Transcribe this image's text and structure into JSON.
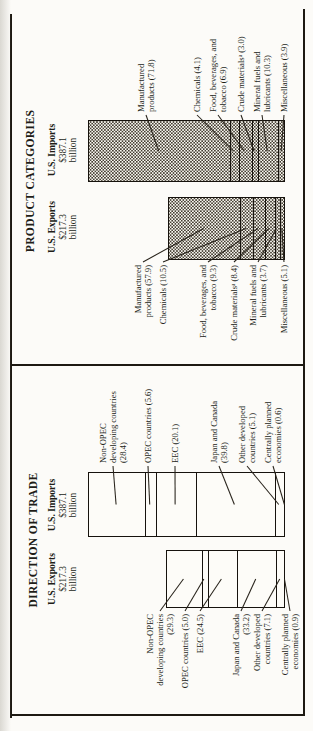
{
  "colors": {
    "ink": "#211d17",
    "paper": "#fcfbf8",
    "rule": "#1d1912"
  },
  "chart_data": [
    {
      "type": "bar",
      "stacked": true,
      "orientation": "vertical",
      "title": "DIRECTION OF TRADE",
      "values_are": "percent of total",
      "legend_position": "none",
      "grid": false,
      "bars": [
        {
          "label": "U.S. Exports",
          "total_label": "$217.3",
          "total_unit": "billion",
          "total_billions": 217.3,
          "label_side": "left",
          "segments": [
            {
              "name": "Non-OPEC developing countries",
              "value": 29.3,
              "label_lines": [
                "Non-OPEC",
                "developing countries",
                "(29.3)"
              ]
            },
            {
              "name": "OPEC countries",
              "value": 5.0,
              "label_lines": [
                "OPEC countries (5.0)"
              ]
            },
            {
              "name": "EEC",
              "value": 24.5,
              "label_lines": [
                "EEC (24.5)"
              ]
            },
            {
              "name": "Japan and Canada",
              "value": 33.2,
              "label_lines": [
                "Japan and Canada",
                "(33.2)"
              ]
            },
            {
              "name": "Other developed countries",
              "value": 7.1,
              "label_lines": [
                "Other developed",
                "countries (7.1)"
              ]
            },
            {
              "name": "Centrally planned economies",
              "value": 0.9,
              "label_lines": [
                "Centrally planned",
                "economies (0.9)"
              ]
            }
          ]
        },
        {
          "label": "U.S. Imports",
          "total_label": "$387.1",
          "total_unit": "billion",
          "total_billions": 387.1,
          "label_side": "right",
          "segments": [
            {
              "name": "Non-OPEC developing countries",
              "value": 28.4,
              "label_lines": [
                "Non-OPEC",
                "developing countries",
                "(28.4)"
              ]
            },
            {
              "name": "OPEC countries",
              "value": 5.6,
              "label_lines": [
                "OPEC countries (5.6)"
              ]
            },
            {
              "name": "EEC",
              "value": 20.1,
              "label_lines": [
                "EEC (20.1)"
              ]
            },
            {
              "name": "Japan and Canada",
              "value": 39.8,
              "label_lines": [
                "Japan and Canada",
                "(39.8)"
              ]
            },
            {
              "name": "Other developed countries",
              "value": 5.1,
              "label_lines": [
                "Other developed",
                "countries (5.1)"
              ]
            },
            {
              "name": "Centrally planned economies",
              "value": 0.6,
              "label_lines": [
                "Centrally planned",
                "economies (0.6)"
              ]
            }
          ]
        }
      ]
    },
    {
      "type": "bar",
      "stacked": true,
      "orientation": "vertical",
      "title": "PRODUCT CATEGORIES",
      "values_are": "percent of total",
      "fill_pattern": "stipple-dots",
      "legend_position": "none",
      "grid": false,
      "bars": [
        {
          "label": "U.S. Exports",
          "total_label": "$217.3",
          "total_unit": "billion",
          "total_billions": 217.3,
          "label_side": "left",
          "segments": [
            {
              "name": "Manufactured products",
              "value": 57.9,
              "label_lines": [
                "Manufactured",
                "products (57.9)"
              ]
            },
            {
              "name": "Chemicals",
              "value": 10.5,
              "label_lines": [
                "Chemicals (10.5)"
              ]
            },
            {
              "name": "Food, beverages, and tobacco",
              "value": 9.3,
              "label_lines": [
                "Food, beverages, and",
                "tobacco (9.3)"
              ]
            },
            {
              "name": "Crude materials",
              "value": 8.4,
              "label_lines": [
                "Crude materialsᵃ (8.4)"
              ]
            },
            {
              "name": "Mineral fuels and lubricants",
              "value": 3.7,
              "label_lines": [
                "Mineral fuels and",
                "lubricants (3.7)"
              ]
            },
            {
              "name": "Miscellaneous",
              "value": 5.1,
              "label_lines": [
                "Miscellaneous (5.1)"
              ]
            }
          ]
        },
        {
          "label": "U.S. Imports",
          "total_label": "$387.1",
          "total_unit": "billion",
          "total_billions": 387.1,
          "label_side": "right",
          "segments": [
            {
              "name": "Manufactured products",
              "value": 71.8,
              "label_lines": [
                "Manufactured",
                "products (71.8)"
              ]
            },
            {
              "name": "Chemicals",
              "value": 4.1,
              "label_lines": [
                "Chemicals (4.1)"
              ]
            },
            {
              "name": "Food, beverages, and tobacco",
              "value": 6.9,
              "label_lines": [
                "Food, beverages, and",
                "tobacco (6.9)"
              ]
            },
            {
              "name": "Crude materials",
              "value": 3.0,
              "label_lines": [
                "Crude materialsᵃ (3.0)"
              ]
            },
            {
              "name": "Mineral fuels and lubricants",
              "value": 10.3,
              "label_lines": [
                "Mineral fuels and",
                "lubricants (10.3)"
              ]
            },
            {
              "name": "Miscellaneous",
              "value": 3.9,
              "label_lines": [
                "Miscellaneous (3.9)"
              ]
            }
          ]
        }
      ]
    }
  ]
}
